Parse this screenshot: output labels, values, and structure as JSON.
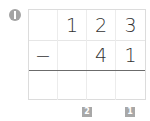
{
  "problem": {
    "marker_label": "1",
    "rows": [
      [
        "",
        "1",
        "2",
        "3"
      ],
      [
        "−",
        "",
        "4",
        "1"
      ],
      [
        "",
        "",
        "",
        ""
      ]
    ],
    "operation": "subtraction",
    "column_badges": [
      {
        "label": "2",
        "column": 2
      },
      {
        "label": "1",
        "column": 3
      }
    ],
    "colors": {
      "marker": "#a3a3a3",
      "badge": "#a8a8a8",
      "rule": "#6b6b6b",
      "grid": "#dcdcdc",
      "digit": "#333333"
    }
  }
}
